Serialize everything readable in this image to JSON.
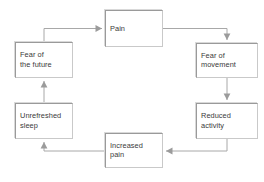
{
  "diagram": {
    "type": "cycle-flowchart",
    "canvas": {
      "width": 264,
      "height": 182,
      "background": "#ffffff"
    },
    "style": {
      "box_fill": "#ffffff",
      "box_border_dark": "#9a9a9a",
      "box_border_light": "#c9c9c9",
      "connector_color": "#a8a8a8",
      "arrowhead_color": "#9b9b9b",
      "text_color": "#3a3a3a"
    },
    "nodes": [
      {
        "id": "pain",
        "label": "Pain",
        "x": 105,
        "y": 10,
        "w": 58,
        "h": 37
      },
      {
        "id": "fear-of-movement",
        "label": "Fear of\nmovement",
        "x": 196,
        "y": 43,
        "w": 62,
        "h": 35
      },
      {
        "id": "reduced-activity",
        "label": "Reduced\nactivity",
        "x": 196,
        "y": 103,
        "w": 62,
        "h": 36
      },
      {
        "id": "increased-pain",
        "label": "Increased\npain",
        "x": 105,
        "y": 133,
        "w": 58,
        "h": 35
      },
      {
        "id": "unrefreshed-sleep",
        "label": "Unrefreshed\nsleep",
        "x": 15,
        "y": 103,
        "w": 58,
        "h": 36
      },
      {
        "id": "fear-of-the-future",
        "label": "Fear of\nthe future",
        "x": 15,
        "y": 42,
        "w": 58,
        "h": 36
      }
    ],
    "edges": [
      {
        "id": "pain-to-fear-of-movement",
        "from": "pain",
        "to": "fear-of-movement",
        "path": "M 163 28.5 L 227 28.5 L 227 40",
        "arrow": "down"
      },
      {
        "id": "fear-of-movement-to-reduced-activity",
        "from": "fear-of-movement",
        "to": "reduced-activity",
        "path": "M 227 78 L 227 100",
        "arrow": "down"
      },
      {
        "id": "reduced-activity-to-increased-pain",
        "from": "reduced-activity",
        "to": "increased-pain",
        "path": "M 227 139 L 227 151 L 166 151",
        "arrow": "left"
      },
      {
        "id": "increased-pain-to-unrefreshed-sleep",
        "from": "increased-pain",
        "to": "unrefreshed-sleep",
        "path": "M 105 151 L 44 151 L 44 142",
        "arrow": "up"
      },
      {
        "id": "unrefreshed-sleep-to-fear-of-the-future",
        "from": "unrefreshed-sleep",
        "to": "fear-of-the-future",
        "path": "M 44 103 L 44 81",
        "arrow": "up"
      },
      {
        "id": "fear-of-the-future-to-pain",
        "from": "fear-of-the-future",
        "to": "pain",
        "path": "M 44 42 L 44 28.5 L 102 28.5",
        "arrow": "right"
      }
    ]
  }
}
